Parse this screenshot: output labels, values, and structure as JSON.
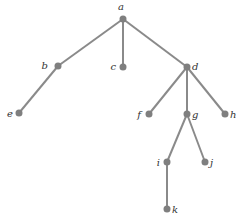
{
  "diagram": {
    "type": "rooted-tree",
    "colors": {
      "edge": "#8a8a8a",
      "node": "#7f7f7f",
      "label": "#333333",
      "background": "#ffffff"
    },
    "nodes": [
      {
        "id": "a",
        "label": "a",
        "x": 123,
        "y": 19,
        "lx": 121,
        "ly": 10,
        "anchor": "middle"
      },
      {
        "id": "b",
        "label": "b",
        "x": 58,
        "y": 66,
        "lx": 48,
        "ly": 69,
        "anchor": "end"
      },
      {
        "id": "c",
        "label": "c",
        "x": 123,
        "y": 67,
        "lx": 116,
        "ly": 70,
        "anchor": "end"
      },
      {
        "id": "d",
        "label": "d",
        "x": 187,
        "y": 67,
        "lx": 192,
        "ly": 70,
        "anchor": "start"
      },
      {
        "id": "e",
        "label": "e",
        "x": 19,
        "y": 113,
        "lx": 13,
        "ly": 117,
        "anchor": "end"
      },
      {
        "id": "f",
        "label": "f",
        "x": 149,
        "y": 114,
        "lx": 141,
        "ly": 118,
        "anchor": "end"
      },
      {
        "id": "g",
        "label": "g",
        "x": 187,
        "y": 114,
        "lx": 192,
        "ly": 118,
        "anchor": "start"
      },
      {
        "id": "h",
        "label": "h",
        "x": 225,
        "y": 114,
        "lx": 230,
        "ly": 118,
        "anchor": "start"
      },
      {
        "id": "i",
        "label": "i",
        "x": 167,
        "y": 162,
        "lx": 160,
        "ly": 166,
        "anchor": "end"
      },
      {
        "id": "j",
        "label": "j",
        "x": 205,
        "y": 162,
        "lx": 210,
        "ly": 166,
        "anchor": "start"
      },
      {
        "id": "k",
        "label": "k",
        "x": 167,
        "y": 209,
        "lx": 172,
        "ly": 213,
        "anchor": "start"
      }
    ],
    "edges": [
      [
        "a",
        "b"
      ],
      [
        "a",
        "c"
      ],
      [
        "a",
        "d"
      ],
      [
        "b",
        "e"
      ],
      [
        "d",
        "f"
      ],
      [
        "d",
        "g"
      ],
      [
        "d",
        "h"
      ],
      [
        "g",
        "i"
      ],
      [
        "g",
        "j"
      ],
      [
        "i",
        "k"
      ]
    ]
  }
}
